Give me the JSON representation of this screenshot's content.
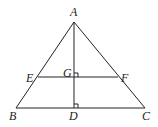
{
  "diagram": {
    "type": "geometry",
    "points": {
      "A": {
        "label": "A",
        "x": 74,
        "y": 22
      },
      "B": {
        "label": "B",
        "x": 16,
        "y": 108
      },
      "C": {
        "label": "C",
        "x": 145,
        "y": 108
      },
      "D": {
        "label": "D",
        "x": 74,
        "y": 108
      },
      "E": {
        "label": "E",
        "x": 38,
        "y": 77
      },
      "F": {
        "label": "F",
        "x": 118,
        "y": 77
      },
      "G": {
        "label": "G",
        "x": 74,
        "y": 77
      }
    },
    "segments": [
      "AB",
      "AC",
      "BC",
      "AD",
      "EF"
    ],
    "right_angles": [
      "G",
      "D"
    ],
    "colors": {
      "stroke": "#222222",
      "background": "#ffffff"
    }
  }
}
